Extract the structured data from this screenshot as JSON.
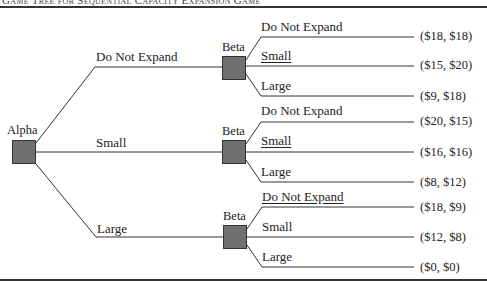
{
  "title": "Game Tree for Sequential Capacity Expansion Game",
  "root": {
    "player": "Alpha"
  },
  "alpha_moves": [
    {
      "label": "Do Not Expand"
    },
    {
      "label": "Small"
    },
    {
      "label": "Large"
    }
  ],
  "beta_nodes": [
    {
      "player": "Beta",
      "moves": [
        {
          "label": "Do Not Expand",
          "underlined": false,
          "payoff": "($18, $18)"
        },
        {
          "label": "Small",
          "underlined": true,
          "payoff": "($15, $20)"
        },
        {
          "label": "Large",
          "underlined": false,
          "payoff": "($9, $18)"
        }
      ]
    },
    {
      "player": "Beta",
      "moves": [
        {
          "label": "Do Not Expand",
          "underlined": false,
          "payoff": "($20, $15)"
        },
        {
          "label": "Small",
          "underlined": true,
          "payoff": "($16, $16)"
        },
        {
          "label": "Large",
          "underlined": false,
          "payoff": "($8, $12)"
        }
      ]
    },
    {
      "player": "Beta",
      "moves": [
        {
          "label": "Do Not Expand",
          "underlined": true,
          "payoff": "($18, $9)"
        },
        {
          "label": "Small",
          "underlined": false,
          "payoff": "($12, $8)"
        },
        {
          "label": "Large",
          "underlined": false,
          "payoff": "($0, $0)"
        }
      ]
    }
  ],
  "colors": {
    "node_fill": "#707070",
    "line": "#333333"
  }
}
